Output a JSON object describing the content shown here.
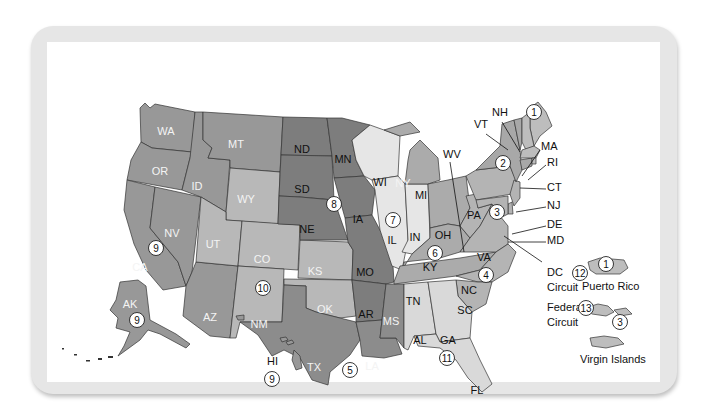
{
  "colors": {
    "frame": "#e6e6e6",
    "circuit_1": "#bdbdbd",
    "circuit_2": "#a8a8a8",
    "circuit_3": "#b4b4b4",
    "circuit_4": "#b4b4b4",
    "circuit_5": "#8c8c8c",
    "circuit_6": "#ababab",
    "circuit_7": "#e6e6e6",
    "circuit_8": "#7d7d7d",
    "circuit_9": "#989898",
    "circuit_10": "#b8b8b8",
    "circuit_11": "#d9d9d9"
  },
  "states": {
    "WA": "WA",
    "OR": "OR",
    "CA": "CA",
    "NV": "NV",
    "ID": "ID",
    "MT": "MT",
    "AZ": "AZ",
    "WY": "WY",
    "UT": "UT",
    "CO": "CO",
    "NM": "NM",
    "KS": "KS",
    "OK": "OK",
    "ND": "ND",
    "SD": "SD",
    "NE": "NE",
    "MN": "MN",
    "IA": "IA",
    "MO": "MO",
    "AR": "AR",
    "TX": "TX",
    "LA": "LA",
    "MS": "MS",
    "WI": "WI",
    "IL": "IL",
    "IN": "IN",
    "MI": "MI",
    "OH": "OH",
    "KY": "KY",
    "TN": "TN",
    "WV": "WV",
    "VA": "VA",
    "NC": "NC",
    "SC": "SC",
    "AL": "AL",
    "GA": "GA",
    "FL": "FL",
    "PA": "PA",
    "NJ": "NJ",
    "DE": "DE",
    "MD": "MD",
    "NY": "NY",
    "VT": "VT",
    "CT": "CT",
    "ME": "ME",
    "NH": "NH",
    "MA": "MA",
    "RI": "RI",
    "AK": "AK",
    "HI": "HI"
  },
  "circuit_markers": [
    {
      "number": "1",
      "region": "New England"
    },
    {
      "number": "2",
      "region": "NY"
    },
    {
      "number": "3",
      "region": "PA"
    },
    {
      "number": "4",
      "region": "VA"
    },
    {
      "number": "5",
      "region": "TX"
    },
    {
      "number": "6",
      "region": "KY/OH"
    },
    {
      "number": "7",
      "region": "IL"
    },
    {
      "number": "8",
      "region": "SD/MN"
    },
    {
      "number": "9",
      "region": "CA/NV"
    },
    {
      "number": "10",
      "region": "CO"
    },
    {
      "number": "11",
      "region": "GA"
    },
    {
      "number": "9",
      "region": "AK"
    },
    {
      "number": "9",
      "region": "HI"
    },
    {
      "number": "1",
      "region": "Puerto Rico"
    },
    {
      "number": "3",
      "region": "Virgin Islands"
    }
  ],
  "special_circuits": {
    "dc": {
      "line1": "DC",
      "line2": "Circuit",
      "number": "12"
    },
    "federal": {
      "line1": "Federal",
      "line2": "Circuit",
      "number": "13"
    }
  },
  "territories": {
    "pr": "Puerto Rico",
    "vi": "Virgin Islands"
  }
}
